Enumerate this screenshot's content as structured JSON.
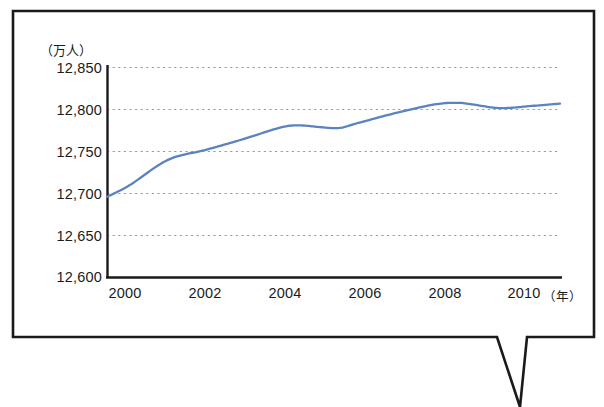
{
  "chart_data": {
    "type": "line",
    "title": "",
    "subtitle": "",
    "ylabel": "（万人）",
    "xlabel": "（年）",
    "xlabel_short": "年",
    "legend": [],
    "grid": true,
    "grid_style": "dotted-horizontal",
    "ylim": [
      12600,
      12850
    ],
    "xlim": [
      1999.4,
      2011.3
    ],
    "ytick_labels": [
      "12,850",
      "12,800",
      "12,750",
      "12,700",
      "12,650",
      "12,600"
    ],
    "ytick_values": [
      12850,
      12800,
      12750,
      12700,
      12650,
      12600
    ],
    "xtick_labels": [
      "2000",
      "2002",
      "2004",
      "2006",
      "2008",
      "2010"
    ],
    "xtick_values": [
      2000,
      2002,
      2004,
      2006,
      2008,
      2010
    ],
    "series": [
      {
        "name": "総人口",
        "color": "#5b83bf",
        "x": [
          1999.4,
          2000,
          2001,
          2002,
          2003,
          2004,
          2004.5,
          2005,
          2005.5,
          2006,
          2007,
          2008,
          2008.6,
          2009,
          2009.6,
          2010,
          2010.5,
          2011.3
        ],
        "values": [
          12696,
          12710,
          12740,
          12752,
          12765,
          12779,
          12781,
          12779,
          12778,
          12784,
          12796,
          12806,
          12808,
          12806,
          12802,
          12802,
          12804,
          12807
        ]
      }
    ],
    "axis_color": "#1a1a1a",
    "gridline_color": "#9a9a9a",
    "frame_color": "#1a1a1a"
  },
  "callout": {
    "shape": "speech-bubble-with-downward-tail",
    "tail_direction": "down"
  }
}
